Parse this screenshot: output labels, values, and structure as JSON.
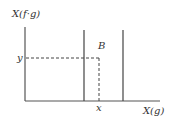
{
  "diagram": {
    "y_axis_label": "X(f·g)",
    "x_axis_label": "X(g)",
    "region_label": "B",
    "y_marker": "y",
    "x_marker": "x",
    "colors": {
      "axis": "#555555",
      "line": "#444444",
      "dashed": "#444444",
      "text": "#333333",
      "background": "#ffffff"
    }
  }
}
